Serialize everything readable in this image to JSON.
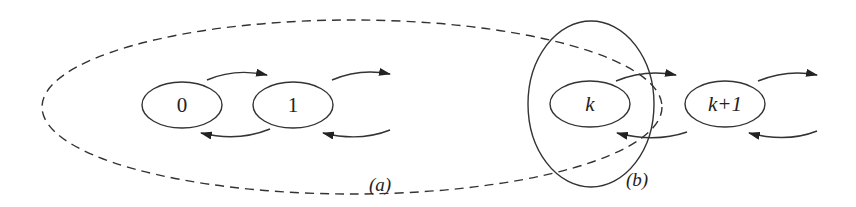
{
  "diagram": {
    "type": "state-transition chain",
    "colors": {
      "stroke": "#333333",
      "background": "#ffffff"
    },
    "states": [
      {
        "id": "s0",
        "label": "0",
        "italic": false
      },
      {
        "id": "s1",
        "label": "1",
        "italic": false
      },
      {
        "id": "sk",
        "label": "k",
        "italic": true
      },
      {
        "id": "sk1",
        "label": "k+1",
        "italic": true
      }
    ],
    "regions": [
      {
        "id": "a",
        "label": "(a)",
        "style": "dashed",
        "encloses": [
          "0",
          "1",
          "...",
          "k"
        ]
      },
      {
        "id": "b",
        "label": "(b)",
        "style": "solid",
        "encloses": [
          "k"
        ]
      }
    ],
    "transitions": [
      {
        "from": "0",
        "to": "1",
        "direction": "forward"
      },
      {
        "from": "1",
        "to": "0",
        "direction": "backward"
      },
      {
        "from": "1",
        "to": "...",
        "direction": "forward"
      },
      {
        "from": "...",
        "to": "1",
        "direction": "backward"
      },
      {
        "from": "k",
        "to": "k+1",
        "direction": "forward"
      },
      {
        "from": "k+1",
        "to": "k",
        "direction": "backward"
      },
      {
        "from": "k+1",
        "to": "...",
        "direction": "forward"
      },
      {
        "from": "...",
        "to": "k+1",
        "direction": "backward"
      }
    ]
  }
}
